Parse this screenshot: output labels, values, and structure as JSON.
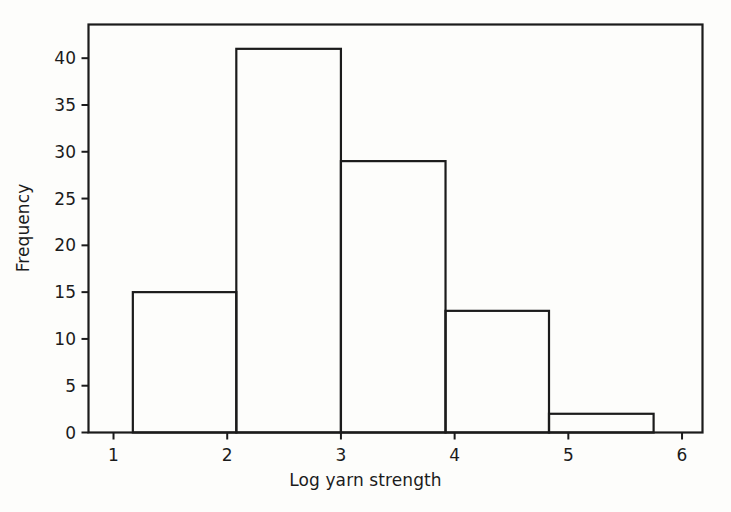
{
  "figure": {
    "background_color": "#fdfdfb",
    "axes_color": "#1b1b1b",
    "bar_edge_color": "#1b1b1b",
    "bar_fill_color": "none"
  },
  "chart_data": {
    "type": "bar",
    "title": "",
    "subtitle": "",
    "xlabel": "Log yarn strength",
    "ylabel": "Frequency",
    "legend": [],
    "legend_position": "none",
    "grid": false,
    "histogram": true,
    "xlim": [
      0.78,
      6.18
    ],
    "ylim": [
      0,
      43.6
    ],
    "xticks": [
      1,
      2,
      3,
      4,
      5,
      6
    ],
    "xtick_labels": [
      "1",
      "2",
      "3",
      "4",
      "5",
      "6"
    ],
    "yticks": [
      0,
      5,
      10,
      15,
      20,
      25,
      30,
      35,
      40
    ],
    "ytick_labels": [
      "0",
      "5",
      "10",
      "15",
      "20",
      "25",
      "30",
      "35",
      "40"
    ],
    "bin_edges": [
      1.17,
      2.08,
      3.0,
      3.92,
      4.83,
      5.75
    ],
    "categories": [
      "1.17-2.08",
      "2.08-3.00",
      "3.00-3.92",
      "3.92-4.83",
      "4.83-5.75"
    ],
    "values": [
      15,
      41,
      29,
      13,
      2
    ],
    "annotations": []
  }
}
